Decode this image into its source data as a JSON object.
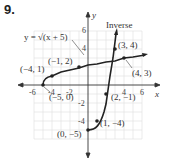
{
  "problem_number": "9.",
  "axes": {
    "x_label": "x",
    "y_label": "y",
    "x_ticks": [
      "-6",
      "-4",
      "-2",
      "4",
      "6"
    ],
    "y_ticks": [
      "6",
      "4",
      "-2",
      "-4"
    ]
  },
  "curves": {
    "function_label": "y = √(x + 5)",
    "inverse_label": "Inverse"
  },
  "points": {
    "p1": "(−4, 1)",
    "p2": "(−1, 2)",
    "p3": "(−5, 0)",
    "p4": "(4, 3)",
    "p5": "(3, 4)",
    "p6": "(2, −1)",
    "p7": "(1, −4)",
    "p8": "(0, −5)"
  },
  "colors": {
    "curve": "#222222",
    "grid": "#dddddd",
    "axis": "#333333"
  }
}
